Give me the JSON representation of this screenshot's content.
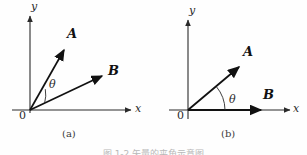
{
  "figure": {
    "caption_clipped": "图 1-2  矢量的夹角示意图",
    "background_color": "#fefefe",
    "stroke_color": "#1a1a1a"
  },
  "panels": [
    {
      "id": "a",
      "caption": "(a)",
      "origin_label": "0",
      "axes": {
        "x_label": "x",
        "y_label": "y"
      },
      "angle_label": "θ",
      "vectors": [
        {
          "name": "A",
          "label": "A",
          "from": [
            30,
            110
          ],
          "to": [
            65,
            48
          ],
          "angle_deg": 60
        },
        {
          "name": "B",
          "label": "B",
          "from": [
            30,
            110
          ],
          "to": [
            105,
            75
          ],
          "angle_deg": 25
        }
      ]
    },
    {
      "id": "b",
      "caption": "(b)",
      "origin_label": "0",
      "axes": {
        "x_label": "x",
        "y_label": "y"
      },
      "angle_label": "θ",
      "vectors": [
        {
          "name": "A",
          "label": "A",
          "from": [
            35,
            110
          ],
          "to": [
            87,
            65
          ],
          "angle_deg": 40
        },
        {
          "name": "B",
          "label": "B",
          "from": [
            35,
            110
          ],
          "to": [
            109,
            110
          ],
          "angle_deg": 0
        }
      ]
    }
  ]
}
